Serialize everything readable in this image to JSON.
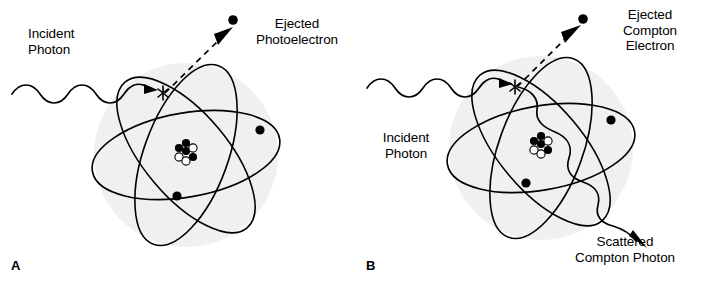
{
  "figure": {
    "background_color": "#ffffff",
    "stroke_color": "#000000",
    "atom_shade_color": "#f0f0f0",
    "width": 710,
    "height": 286
  },
  "panels": [
    {
      "id": "A",
      "letter": "A",
      "interaction": "photoelectric-effect",
      "labels": {
        "incident_photon": "Incident\nPhoton",
        "ejected_particle": "Ejected\nPhotoelectron"
      },
      "atom": {
        "shell_count": 3,
        "orbital_electron_count": 2,
        "nucleus_particles": 7,
        "interaction_marker": "asterisk"
      },
      "rays": {
        "incident": "wavy-arrow-in",
        "ejected": "dashed-arrow-out"
      }
    },
    {
      "id": "B",
      "letter": "B",
      "interaction": "compton-scattering",
      "labels": {
        "incident_photon": "Incident\nPhoton",
        "ejected_particle": "Ejected\nCompton\nElectron",
        "scattered_photon": "Scattered\nCompton Photon"
      },
      "atom": {
        "shell_count": 3,
        "orbital_electron_count": 2,
        "nucleus_particles": 7,
        "interaction_marker": "asterisk"
      },
      "rays": {
        "incident": "wavy-arrow-in",
        "ejected": "dashed-arrow-out",
        "scattered": "wavy-arrow-out"
      }
    }
  ]
}
